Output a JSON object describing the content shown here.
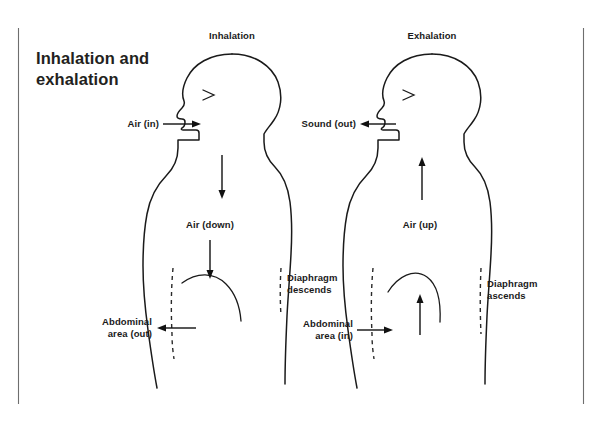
{
  "page": {
    "title": "Inhalation and\nexhalation",
    "background_color": "#ffffff",
    "ink_color": "#1a1a1a",
    "rule_color": "#6e6e6e"
  },
  "panels": [
    {
      "id": "inhalation",
      "heading": "Inhalation",
      "labels": {
        "mouth": "Air (in)",
        "torso": "Air (down)",
        "diaphragm": "Diaphragm\ndescends",
        "abdomen": "Abdominal\narea (out)"
      },
      "arrows": {
        "mouth_direction": "right",
        "throat_direction": "down",
        "torso_direction": "down",
        "abdomen_direction": "left"
      }
    },
    {
      "id": "exhalation",
      "heading": "Exhalation",
      "labels": {
        "mouth": "Sound (out)",
        "torso": "Air (up)",
        "diaphragm": "Diaphragm\nascends",
        "abdomen": "Abdominal\narea (in)"
      },
      "arrows": {
        "mouth_direction": "left",
        "throat_direction": "up",
        "torso_direction": "up",
        "abdomen_direction": "right"
      }
    }
  ]
}
